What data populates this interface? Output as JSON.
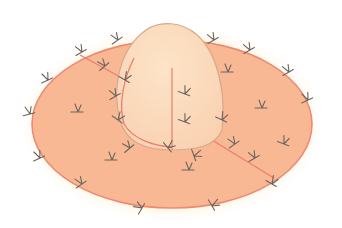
{
  "figure": {
    "colors": {
      "background": "#ffffff",
      "halo": "#fff3dc",
      "base_fill": "#f8b894",
      "base_outline": "#ee8a72",
      "dome_fill": "#fcdcbe",
      "dome_outline": "#d8a88c",
      "seam": "#ec7e6c",
      "mark": "#6b6560"
    },
    "marks": [
      {
        "x": 118,
        "y": 40,
        "a": -35
      },
      {
        "x": 82,
        "y": 52,
        "a": -30
      },
      {
        "x": 105,
        "y": 66,
        "a": -40
      },
      {
        "x": 48,
        "y": 80,
        "a": -25
      },
      {
        "x": 125,
        "y": 80,
        "a": 30
      },
      {
        "x": 116,
        "y": 96,
        "a": -30
      },
      {
        "x": 30,
        "y": 114,
        "a": -15
      },
      {
        "x": 78,
        "y": 112,
        "a": 0
      },
      {
        "x": 118,
        "y": 120,
        "a": 35
      },
      {
        "x": 130,
        "y": 148,
        "a": -40
      },
      {
        "x": 40,
        "y": 158,
        "a": -25
      },
      {
        "x": 112,
        "y": 160,
        "a": 0
      },
      {
        "x": 82,
        "y": 184,
        "a": -35
      },
      {
        "x": 142,
        "y": 208,
        "a": -60
      },
      {
        "x": 214,
        "y": 40,
        "a": -30
      },
      {
        "x": 250,
        "y": 50,
        "a": -30
      },
      {
        "x": 228,
        "y": 72,
        "a": 0
      },
      {
        "x": 289,
        "y": 72,
        "a": -30
      },
      {
        "x": 308,
        "y": 100,
        "a": -25
      },
      {
        "x": 262,
        "y": 108,
        "a": 0
      },
      {
        "x": 185,
        "y": 94,
        "a": 20
      },
      {
        "x": 185,
        "y": 122,
        "a": 20
      },
      {
        "x": 222,
        "y": 120,
        "a": 25
      },
      {
        "x": 235,
        "y": 144,
        "a": -35
      },
      {
        "x": 255,
        "y": 158,
        "a": -30
      },
      {
        "x": 189,
        "y": 170,
        "a": 0
      },
      {
        "x": 284,
        "y": 144,
        "a": 20
      },
      {
        "x": 272,
        "y": 184,
        "a": 30
      },
      {
        "x": 212,
        "y": 206,
        "a": 60
      },
      {
        "x": 194,
        "y": 156,
        "a": 70
      },
      {
        "x": 168,
        "y": 148,
        "a": 50
      }
    ]
  }
}
